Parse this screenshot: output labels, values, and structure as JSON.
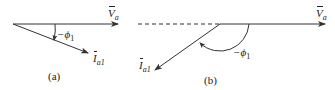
{
  "diagram": {
    "panel_a": {
      "caption": "(a)",
      "voltage_label": "V",
      "voltage_sub": "a",
      "current_label": "I",
      "current_sub": "a1",
      "angle_label": "−ϕ",
      "angle_sub": "1"
    },
    "panel_b": {
      "caption": "(b)",
      "voltage_label": "V",
      "voltage_sub": "a",
      "current_label": "I",
      "current_sub": "a1",
      "angle_label": "−ϕ",
      "angle_sub": "1"
    },
    "colors": {
      "line": "#333333",
      "text": "#222222"
    }
  }
}
